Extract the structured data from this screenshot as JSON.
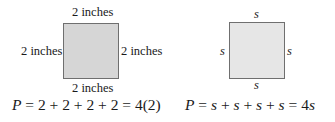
{
  "left_square": {
    "top_label": "2 inches",
    "left_label": "2 inches",
    "right_label": "2 inches",
    "bottom_label": "2 inches",
    "fill": "#d6d6d6",
    "formula": {
      "var": "P",
      "expr": " = 2 + 2 + 2 + 2 = 4(2)"
    }
  },
  "right_square": {
    "top_label": "s",
    "left_label": "s",
    "right_label": "s",
    "bottom_label": "s",
    "fill": "#e6e6e6",
    "formula": {
      "var": "P",
      "eq1": " = ",
      "s1": "s",
      "plus1": " + ",
      "s2": "s",
      "plus2": " + ",
      "s3": "s",
      "plus3": " + ",
      "s4": "s",
      "eq2": " = 4",
      "s5": "s"
    }
  }
}
